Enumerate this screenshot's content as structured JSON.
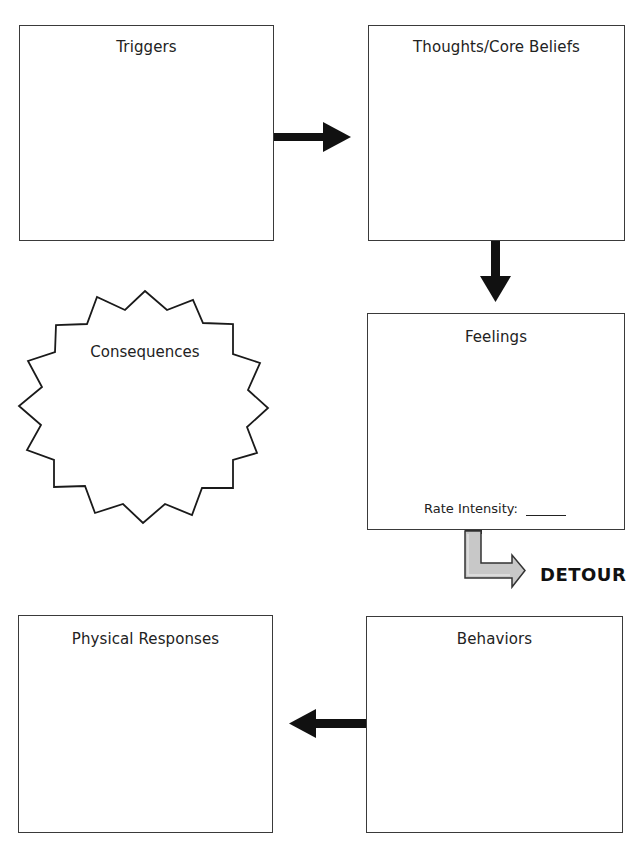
{
  "diagram": {
    "boxes": {
      "triggers": {
        "title": "Triggers"
      },
      "thoughts": {
        "title": "Thoughts/Core Beliefs"
      },
      "feelings": {
        "title": "Feelings",
        "rate_label": "Rate Intensity:",
        "rate_value": ""
      },
      "physical": {
        "title": "Physical Responses"
      },
      "behaviors": {
        "title": "Behaviors"
      }
    },
    "consequences": {
      "title": "Consequences",
      "shape": "starburst"
    },
    "detour": {
      "label": "DETOUR",
      "arrow_fill": "#c8c8c8"
    },
    "arrows": [
      {
        "from": "Triggers",
        "to": "Thoughts/Core Beliefs",
        "direction": "right"
      },
      {
        "from": "Thoughts/Core Beliefs",
        "to": "Feelings",
        "direction": "down"
      },
      {
        "from": "Feelings",
        "to": "DETOUR",
        "direction": "down-right",
        "style": "outlined-gray"
      },
      {
        "from": "Behaviors",
        "to": "Physical Responses",
        "direction": "left"
      }
    ],
    "colors": {
      "stroke": "#1a1a1a",
      "box_border": "#3a3a3a",
      "background": "#ffffff"
    }
  }
}
